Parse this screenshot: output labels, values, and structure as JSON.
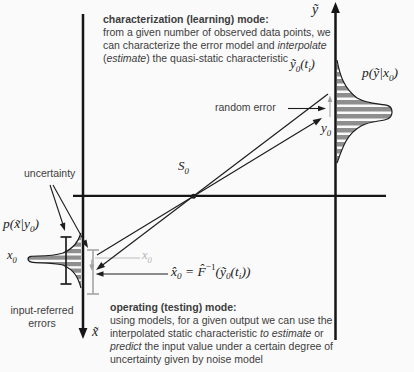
{
  "figure": {
    "charmode": {
      "title": "characterization (learning) mode:",
      "l2": "from a given number of observed data points, we",
      "l3a": "can characterize the error model and ",
      "l3b": "interpolate",
      "l4a": "(",
      "l4b": "estimate",
      "l4c": ") the quasi-static characteristic"
    },
    "opmode": {
      "title": "operating (testing) mode:",
      "l2": "using models, for a given output we can use the",
      "l3a": "interpolated static characteristic ",
      "l3b": "to estimate",
      "l3c": " or",
      "l4a": "predict",
      "l4b": " the input value under a certain degree of",
      "l5": "uncertainty given by noise model"
    },
    "labels": {
      "y_axis": "ỹ",
      "x_axis": "x̃",
      "y0_ti": {
        "m1": "ỹ",
        "sub1": "0",
        "m2": "(t",
        "sub2": "i",
        "m3": ")"
      },
      "p_y_x0": {
        "m1": "p(ỹ|x",
        "sub1": "0",
        "m2": ")"
      },
      "random_error": "random error",
      "y0": {
        "m1": "y",
        "sub1": "0"
      },
      "s0": {
        "m1": "S",
        "sub1": "0"
      },
      "uncertainty": "uncertainty",
      "p_x_y0": {
        "m1": "p(x̃|y",
        "sub1": "0",
        "m2": ")"
      },
      "x0_true": {
        "m1": "x",
        "sub1": "0"
      },
      "x0_marker": {
        "m1": "x",
        "sub1": "0"
      },
      "formula": {
        "m1": "x̂",
        "sub1": "0",
        "m2": " = ",
        "m3": "F̂",
        "sup1": "−1",
        "m4": "(ỹ",
        "sub2": "0",
        "m5": "(t",
        "sub3": "i",
        "m6": "))"
      },
      "input_referred_l1": "input-referred",
      "input_referred_l2": "errors"
    },
    "colors": {
      "axis": "#151515",
      "line": "#1d1d1d",
      "gray_indicator": "#a9a9a9",
      "hatch_fill": "#8e8e8e",
      "prose_text": "#3d3d3d",
      "math_text": "#1b1b1b",
      "background": "#fafafa"
    }
  }
}
